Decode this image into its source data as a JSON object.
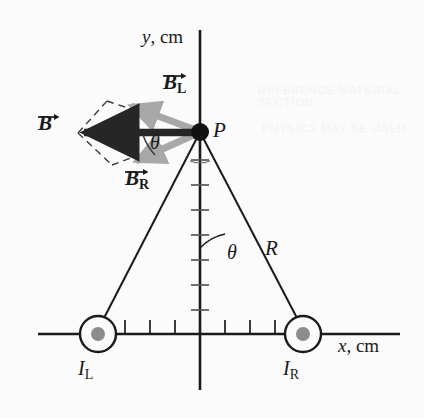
{
  "figure": {
    "background_color": "#fbfbfb",
    "line_color": "#1a1a1a",
    "gray_vector_color": "#a8a8a8",
    "wire_dot_color": "#8c8c8c"
  },
  "axes": {
    "x_label_italic": "x",
    "x_label_unit": ", cm",
    "y_label_italic": "y",
    "y_label_unit": ", cm",
    "origin_px": [
      200,
      334
    ],
    "x_axis_span_px": [
      38,
      400
    ],
    "y_axis_span_px": [
      30,
      390
    ],
    "tick_spacing_px": 25,
    "x_ticks_px": [
      125,
      150,
      175,
      225,
      250,
      275
    ],
    "y_ticks_px": [
      160,
      185,
      210,
      235,
      260,
      285,
      310
    ]
  },
  "labels": {
    "point_p": "P",
    "resultant_vector": "B",
    "left_vector": "B",
    "left_vector_sub": "L",
    "right_vector": "B",
    "right_vector_sub": "R",
    "left_current": "I",
    "left_current_sub": "L",
    "right_current": "I",
    "right_current_sub": "R",
    "radius": "R",
    "angle_upper": "θ",
    "angle_lower": "θ"
  },
  "elements": {
    "point_p_px": [
      200,
      132
    ],
    "left_wire_px": [
      98,
      334
    ],
    "right_wire_px": [
      303,
      334
    ],
    "wire_outer_radius_px": 18,
    "wire_inner_radius_px": 7,
    "resultant_tip_px": [
      78,
      133
    ],
    "left_vector_tip_px": [
      127,
      104
    ],
    "right_vector_tip_px": [
      132,
      163
    ],
    "parallelogram_corner_upper_px": [
      107,
      101
    ],
    "parallelogram_corner_lower_px": [
      112,
      165
    ]
  },
  "bleed_text": {
    "line1": "REFERENCE MATERIAL SECTION",
    "line2": "PHYSICS MAY BE USED"
  }
}
